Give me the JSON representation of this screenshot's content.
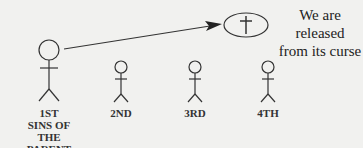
{
  "diagram": {
    "figures": [
      {
        "label_line1": "1ST",
        "label_line2": "SINS OF",
        "label_line3": "THE PARENT"
      },
      {
        "label_line1": "2ND"
      },
      {
        "label_line1": "3RD"
      },
      {
        "label_line1": "4TH"
      }
    ],
    "symbol": "†",
    "message_line1": "We are released",
    "message_line2": "from its curse"
  }
}
